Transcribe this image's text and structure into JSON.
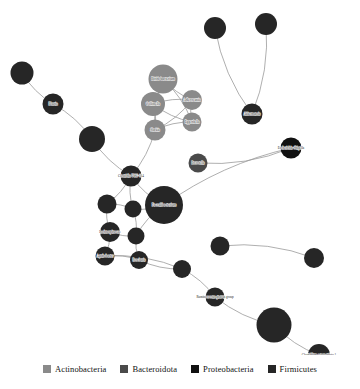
{
  "figure": {
    "background_color": "#ffffff",
    "width": 360,
    "height": 389
  },
  "legend": {
    "position": "bottom-center",
    "items": [
      {
        "label": "Actinobacteria",
        "color": "#8a8a8a"
      },
      {
        "label": "Bacteroidota",
        "color": "#4a4a4a"
      },
      {
        "label": "Proteobacteria",
        "color": "#111111"
      },
      {
        "label": "Firmicutes",
        "color": "#262626"
      }
    ]
  },
  "chart_data": {
    "type": "scatter",
    "title": "",
    "xlabel": "",
    "ylabel": "",
    "layout": "network graph (node-link diagram)",
    "grid": false,
    "legend_position": "bottom-center",
    "group_colors": {
      "Actinobacteria": "#8a8a8a",
      "Bacteroidota": "#4a4a4a",
      "Proteobacteria": "#111111",
      "Firmicutes": "#262626"
    },
    "edge_color": "#9a9a9a",
    "nodes": [
      {
        "id": "n1",
        "label": "",
        "x": 22,
        "y": 73,
        "r": 11.5,
        "group": "Firmicutes"
      },
      {
        "id": "n2",
        "label": "Blautia",
        "x": 53,
        "y": 104,
        "r": 10.5,
        "group": "Firmicutes"
      },
      {
        "id": "n3",
        "label": "",
        "x": 92,
        "y": 139,
        "r": 13.0,
        "group": "Firmicutes"
      },
      {
        "id": "n4",
        "label": "Clostridia UCG-014",
        "x": 131,
        "y": 176,
        "r": 10.5,
        "group": "Firmicutes"
      },
      {
        "id": "n5",
        "label": "Bifidobacterium",
        "x": 163,
        "y": 79,
        "r": 14.5,
        "group": "Actinobacteria"
      },
      {
        "id": "n6",
        "label": "Collinsella",
        "x": 153,
        "y": 104,
        "r": 12.0,
        "group": "Actinobacteria"
      },
      {
        "id": "n7",
        "label": "Adlercreutzia",
        "x": 192,
        "y": 100,
        "r": 10.0,
        "group": "Actinobacteria"
      },
      {
        "id": "n8",
        "label": "Eggerthella",
        "x": 192,
        "y": 122,
        "r": 9.5,
        "group": "Actinobacteria"
      },
      {
        "id": "n9",
        "label": "Slackia",
        "x": 155,
        "y": 130,
        "r": 10.5,
        "group": "Actinobacteria"
      },
      {
        "id": "n10",
        "label": "",
        "x": 215,
        "y": 28,
        "r": 11.0,
        "group": "Firmicutes"
      },
      {
        "id": "n11",
        "label": "",
        "x": 266,
        "y": 24,
        "r": 11.0,
        "group": "Firmicutes"
      },
      {
        "id": "n12",
        "label": "Akkermansia",
        "x": 252,
        "y": 114,
        "r": 10.5,
        "group": "Firmicutes"
      },
      {
        "id": "n13",
        "label": "Escherichia-Shigella",
        "x": 291,
        "y": 148,
        "r": 10.5,
        "group": "Proteobacteria"
      },
      {
        "id": "n14",
        "label": "Prevotella",
        "x": 198,
        "y": 163,
        "r": 9.5,
        "group": "Bacteroidota"
      },
      {
        "id": "n15",
        "label": "Faecalibacterium",
        "x": 164,
        "y": 205,
        "r": 19.0,
        "group": "Firmicutes"
      },
      {
        "id": "n16",
        "label": "",
        "x": 107,
        "y": 204,
        "r": 9.5,
        "group": "Firmicutes"
      },
      {
        "id": "n17",
        "label": "",
        "x": 133,
        "y": 209,
        "r": 8.5,
        "group": "Firmicutes"
      },
      {
        "id": "n18",
        "label": "Lachnospiraceae",
        "x": 110,
        "y": 232,
        "r": 10.0,
        "group": "Firmicutes"
      },
      {
        "id": "n19",
        "label": "",
        "x": 136,
        "y": 236,
        "r": 8.5,
        "group": "Firmicutes"
      },
      {
        "id": "n20",
        "label": "Agathobacter",
        "x": 105,
        "y": 256,
        "r": 9.5,
        "group": "Firmicutes"
      },
      {
        "id": "n21",
        "label": "Roseburia",
        "x": 139,
        "y": 260,
        "r": 9.0,
        "group": "Firmicutes"
      },
      {
        "id": "n22",
        "label": "",
        "x": 182,
        "y": 269,
        "r": 9.0,
        "group": "Firmicutes"
      },
      {
        "id": "n23",
        "label": "Ruminococcus gnavus group",
        "x": 215,
        "y": 297,
        "r": 9.5,
        "group": "Firmicutes"
      },
      {
        "id": "n24",
        "label": "",
        "x": 220,
        "y": 246,
        "r": 9.5,
        "group": "Firmicutes"
      },
      {
        "id": "n25",
        "label": "",
        "x": 314,
        "y": 258,
        "r": 10.0,
        "group": "Firmicutes"
      },
      {
        "id": "n26",
        "label": "",
        "x": 274,
        "y": 325,
        "r": 17.5,
        "group": "Firmicutes"
      },
      {
        "id": "n27",
        "label": "Clostridium sensu stricto 1",
        "x": 319,
        "y": 355,
        "r": 11.0,
        "group": "Firmicutes"
      }
    ],
    "edges": [
      {
        "source": "n1",
        "target": "n2"
      },
      {
        "source": "n2",
        "target": "n3"
      },
      {
        "source": "n3",
        "target": "n4"
      },
      {
        "source": "n5",
        "target": "n6"
      },
      {
        "source": "n5",
        "target": "n7"
      },
      {
        "source": "n5",
        "target": "n8"
      },
      {
        "source": "n5",
        "target": "n9"
      },
      {
        "source": "n6",
        "target": "n7"
      },
      {
        "source": "n6",
        "target": "n8"
      },
      {
        "source": "n6",
        "target": "n9"
      },
      {
        "source": "n7",
        "target": "n8"
      },
      {
        "source": "n7",
        "target": "n9"
      },
      {
        "source": "n8",
        "target": "n9"
      },
      {
        "source": "n9",
        "target": "n4"
      },
      {
        "source": "n10",
        "target": "n12"
      },
      {
        "source": "n11",
        "target": "n12"
      },
      {
        "source": "n14",
        "target": "n13"
      },
      {
        "source": "n15",
        "target": "n13"
      },
      {
        "source": "n4",
        "target": "n15"
      },
      {
        "source": "n4",
        "target": "n16"
      },
      {
        "source": "n4",
        "target": "n17"
      },
      {
        "source": "n16",
        "target": "n17"
      },
      {
        "source": "n16",
        "target": "n18"
      },
      {
        "source": "n17",
        "target": "n19"
      },
      {
        "source": "n18",
        "target": "n19"
      },
      {
        "source": "n18",
        "target": "n20"
      },
      {
        "source": "n19",
        "target": "n21"
      },
      {
        "source": "n20",
        "target": "n21"
      },
      {
        "source": "n15",
        "target": "n19"
      },
      {
        "source": "n15",
        "target": "n17"
      },
      {
        "source": "n21",
        "target": "n22"
      },
      {
        "source": "n22",
        "target": "n23"
      },
      {
        "source": "n23",
        "target": "n26"
      },
      {
        "source": "n24",
        "target": "n25"
      },
      {
        "source": "n26",
        "target": "n27"
      },
      {
        "source": "n20",
        "target": "n22"
      }
    ]
  }
}
